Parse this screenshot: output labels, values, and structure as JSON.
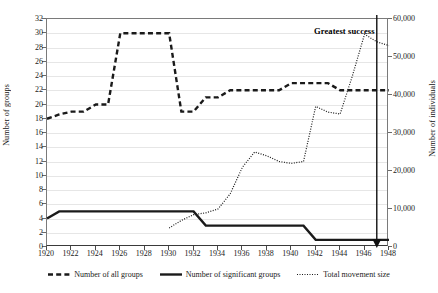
{
  "chart_data": {
    "type": "line",
    "title": "",
    "xlabel": "",
    "ylabel": "Number of groups",
    "y2label": "Number of individuals",
    "x": [
      1920,
      1921,
      1922,
      1923,
      1924,
      1925,
      1926,
      1927,
      1928,
      1929,
      1930,
      1931,
      1932,
      1933,
      1934,
      1935,
      1936,
      1937,
      1938,
      1939,
      1940,
      1941,
      1942,
      1943,
      1944,
      1945,
      1946,
      1947,
      1948
    ],
    "xlim": [
      1920,
      1948
    ],
    "ylim": [
      0,
      32
    ],
    "y2lim": [
      0,
      60000
    ],
    "grid": true,
    "legend_position": "bottom",
    "xticks": [
      "1920",
      "1922",
      "1924",
      "1926",
      "1928",
      "1930",
      "1932",
      "1934",
      "1936",
      "1938",
      "1940",
      "1942",
      "1944",
      "1946",
      "1948"
    ],
    "yticks": [
      "0",
      "2",
      "4",
      "6",
      "8",
      "10",
      "12",
      "14",
      "16",
      "18",
      "20",
      "22",
      "24",
      "26",
      "28",
      "30",
      "32"
    ],
    "y2ticks": [
      "0",
      "10,000",
      "20,000",
      "30,000",
      "40,000",
      "50,000",
      "60,000"
    ],
    "series": [
      {
        "name": "Number of all groups",
        "style": "dashed",
        "axis": "left",
        "values": [
          18,
          18.6,
          19,
          19,
          20,
          20,
          30,
          30,
          30,
          30,
          30,
          19,
          19,
          21,
          21,
          22,
          22,
          22,
          22,
          22,
          23,
          23,
          23,
          23,
          22,
          22,
          22,
          22,
          22
        ]
      },
      {
        "name": "Number of significant groups",
        "style": "solid",
        "axis": "left",
        "values": [
          4,
          5,
          5,
          5,
          5,
          5,
          5,
          5,
          5,
          5,
          5,
          5,
          5,
          3,
          3,
          3,
          3,
          3,
          3,
          3,
          3,
          3,
          1,
          1,
          1,
          1,
          1,
          1,
          1
        ]
      },
      {
        "name": "Total movement size",
        "style": "dotted",
        "axis": "right",
        "values": [
          null,
          null,
          null,
          null,
          null,
          null,
          null,
          null,
          null,
          null,
          5000,
          7000,
          8500,
          9000,
          10000,
          14000,
          21000,
          25000,
          24000,
          22500,
          22000,
          22500,
          37000,
          35500,
          35000,
          45000,
          56000,
          54000,
          53000
        ]
      }
    ],
    "annotations": [
      {
        "text": "Greatest success",
        "x": 1947,
        "y2": 60000
      }
    ]
  },
  "legend": {
    "items": [
      {
        "label": "Number of all groups",
        "style": "dashed"
      },
      {
        "label": "Number of significant groups",
        "style": "solid"
      },
      {
        "label": "Total movement size",
        "style": "dotted"
      }
    ]
  },
  "axes": {
    "left_title": "Number of groups",
    "right_title": "Number of individuals"
  },
  "colors": {
    "line": "#1a1a1a",
    "grid": "#e6e6e6",
    "frame": "#7a7a7a",
    "text": "#1a1a1a"
  }
}
